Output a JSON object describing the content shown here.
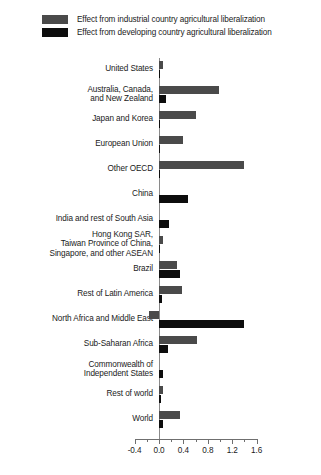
{
  "legend": {
    "position": "top-left",
    "items": [
      {
        "label": "Effect from industrial country agricultural liberalization",
        "color": "#4a4a4a",
        "series": "industrial"
      },
      {
        "label": "Effect from developing country agricultural liberalization",
        "color": "#0d0d0d",
        "series": "developing"
      }
    ]
  },
  "chart_data": {
    "type": "bar",
    "orientation": "horizontal",
    "title": "",
    "subtitle": "",
    "xlabel": "",
    "ylabel": "",
    "xlim": [
      -0.4,
      1.6
    ],
    "grid": false,
    "legend_position": "top-left",
    "xticks": [
      -0.4,
      0.0,
      0.4,
      0.8,
      1.2,
      1.6
    ],
    "xtick_labels": [
      "-0.4",
      "0.0",
      "0.4",
      "0.8",
      "1.2",
      "1.6"
    ],
    "minor_tick_step": 0.2,
    "categories": [
      "United States",
      "Australia, Canada,\nand New Zealand",
      "Japan and Korea",
      "European Union",
      "Other OECD",
      "China",
      "India and rest of South Asia",
      "Hong Kong SAR,\nTaiwan Province of China,\nSingapore, and other ASEAN",
      "Brazil",
      "Rest of Latin America",
      "North Africa and Middle East",
      "Sub-Saharan Africa",
      "Commonwealth of\nIndependent States",
      "Rest of world",
      "World"
    ],
    "series": [
      {
        "name": "Effect from industrial country agricultural liberalization",
        "color": "#4a4a4a",
        "values": [
          0.06,
          0.98,
          0.61,
          0.4,
          1.4,
          0.0,
          0.0,
          0.07,
          0.29,
          0.38,
          -0.16,
          0.62,
          0.0,
          0.07,
          0.35
        ]
      },
      {
        "name": "Effect from developing country agricultural liberalization",
        "color": "#0d0d0d",
        "values": [
          0.01,
          0.12,
          0.02,
          0.01,
          0.02,
          0.47,
          0.17,
          0.02,
          0.35,
          0.05,
          1.4,
          0.14,
          0.07,
          0.04,
          0.06
        ]
      }
    ]
  }
}
